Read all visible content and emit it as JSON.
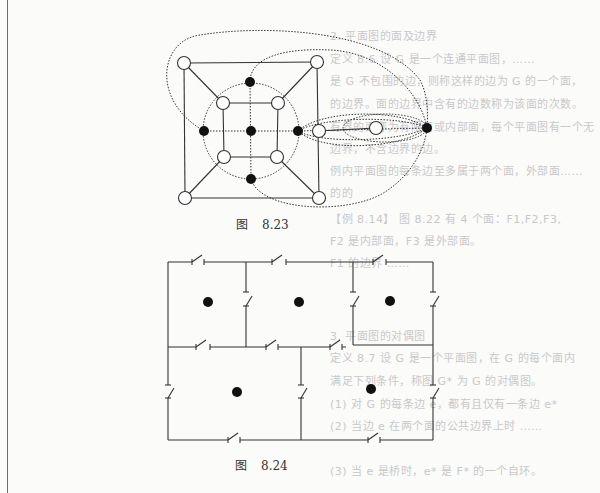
{
  "page": {
    "background": "#fbfbfa",
    "ink": "#222222"
  },
  "ghost_text": [
    {
      "text": "2. 平面图的面及边界",
      "x": 330,
      "y": 35
    },
    {
      "text": "定义 8.6  设 G 是一个连通平面图，……",
      "x": 330,
      "y": 58
    },
    {
      "text": "是 G 不包围的边，则称这样的边为 G 的一个面，",
      "x": 330,
      "y": 80
    },
    {
      "text": "的边界。面的边界中含有的边数称为该面的次数。",
      "x": 330,
      "y": 103
    },
    {
      "text": "有界的面称为有限面或内部面，每个平面图有一个无",
      "x": 330,
      "y": 126
    },
    {
      "text": "边界，不含边界的边。",
      "x": 330,
      "y": 148
    },
    {
      "text": "例内平面图的每条边至多属于两个面，外部面……",
      "x": 330,
      "y": 170
    },
    {
      "text": "的的",
      "x": 330,
      "y": 192
    },
    {
      "text": "【例 8.14】 图 8.22 有 4 个面：F1,F2,F3,",
      "x": 330,
      "y": 218
    },
    {
      "text": "F2 是内部面，F3 是外部面。",
      "x": 330,
      "y": 240
    },
    {
      "text": "F1 的边界 ……",
      "x": 330,
      "y": 262
    },
    {
      "text": "3. 平面图的对偶图",
      "x": 330,
      "y": 335
    },
    {
      "text": "定义 8.7  设 G 是一个平面图，在 G 的每个面内",
      "x": 330,
      "y": 357
    },
    {
      "text": "满足下列条件，称图 G* 为 G 的对偶图。",
      "x": 330,
      "y": 380
    },
    {
      "text": "(1) 对 G 的每条边 e，都有且仅有一条边 e*",
      "x": 330,
      "y": 403
    },
    {
      "text": "(2) 当边 e 在两个面的公共边界上时 ……",
      "x": 330,
      "y": 425
    },
    {
      "text": "(3) 当 e 是桥时，e* 是 F* 的一个自环。",
      "x": 330,
      "y": 470
    }
  ],
  "figures": [
    {
      "id": "fig-8-23",
      "caption_prefix": "图",
      "caption_number": "8.23",
      "caption_pos": {
        "x": 236,
        "y": 215
      },
      "description": "Plane graph (white vertices, solid edges) with its dual graph (black vertices, dotted edges)",
      "white_nodes": [
        {
          "id": "TL",
          "x": 184,
          "y": 63
        },
        {
          "id": "TR",
          "x": 317,
          "y": 62
        },
        {
          "id": "BL",
          "x": 185,
          "y": 198
        },
        {
          "id": "BR",
          "x": 319,
          "y": 198
        },
        {
          "id": "iTL",
          "x": 223,
          "y": 103
        },
        {
          "id": "iTR",
          "x": 278,
          "y": 103
        },
        {
          "id": "iBL",
          "x": 224,
          "y": 157
        },
        {
          "id": "iBR",
          "x": 277,
          "y": 157
        },
        {
          "id": "R",
          "x": 319,
          "y": 131
        },
        {
          "id": "RR",
          "x": 376,
          "y": 128
        }
      ],
      "black_nodes": [
        {
          "id": "top",
          "x": 250,
          "y": 82
        },
        {
          "id": "left",
          "x": 204,
          "y": 131
        },
        {
          "id": "center",
          "x": 251,
          "y": 131
        },
        {
          "id": "right",
          "x": 298,
          "y": 131
        },
        {
          "id": "bottom",
          "x": 251,
          "y": 179
        },
        {
          "id": "outer",
          "x": 427,
          "y": 128
        }
      ]
    },
    {
      "id": "fig-8-24",
      "caption_prefix": "图",
      "caption_number": "8.24",
      "caption_pos": {
        "x": 235,
        "y": 456
      },
      "description": "Switch circuit layout with five regions, each marked by a black dot",
      "dots": [
        {
          "x": 208,
          "y": 302
        },
        {
          "x": 299,
          "y": 302
        },
        {
          "x": 390,
          "y": 301
        },
        {
          "x": 237,
          "y": 392
        },
        {
          "x": 371,
          "y": 389
        }
      ]
    }
  ]
}
